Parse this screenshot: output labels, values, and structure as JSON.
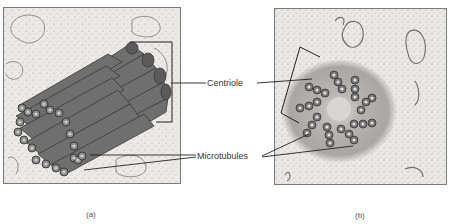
{
  "figure": {
    "panels": [
      {
        "id": "a",
        "caption": "(a)",
        "description": "3D illustration of a centriole as a cylinder of microtubule triplets"
      },
      {
        "id": "b",
        "caption": "(b)",
        "description": "Cross-section micrograph of a centriole showing nine microtubule triplets"
      }
    ],
    "labels": {
      "centriole": "Centriole",
      "microtubules": "Microtubules"
    }
  }
}
